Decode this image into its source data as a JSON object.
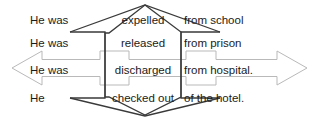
{
  "diagram": {
    "colors": {
      "dark_arrow": "#3a3a3a",
      "light_arrow": "#b9b9b9",
      "text": "#1b1b1b",
      "background": "#ffffff"
    },
    "rows": [
      {
        "subject": "He was",
        "verb": "expelled",
        "object": "from school"
      },
      {
        "subject": "He was",
        "verb": "released",
        "object": "from prison"
      },
      {
        "subject": "He was",
        "verb": "discharged",
        "object": "from hospital."
      },
      {
        "subject": "He",
        "verb": "checked out",
        "object": "of the hotel."
      }
    ],
    "arrows": {
      "dark": {
        "name": "vertical-double-arrow-dark",
        "orientation": "vertical-span",
        "description": "Dark double-headed arrow pointing up and down spanning rows 1 through 4"
      },
      "light": {
        "name": "horizontal-double-arrow-light",
        "orientation": "horizontal",
        "description": "Light gray double-headed arrow pointing left and right across row 3"
      }
    }
  }
}
